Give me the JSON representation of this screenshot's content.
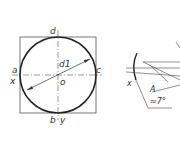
{
  "figure_left": {
    "labels": {
      "top": "d",
      "left": "a",
      "right": "c",
      "bottom": "b",
      "bottom_axis": "y",
      "left_axis": "x",
      "center": "o",
      "diameter": "d1"
    }
  },
  "figure_right": {
    "labels": {
      "axis": "x",
      "point": "A",
      "angle": "≈7°"
    }
  },
  "colors": {
    "line": "#333333",
    "thin": "#555555"
  }
}
